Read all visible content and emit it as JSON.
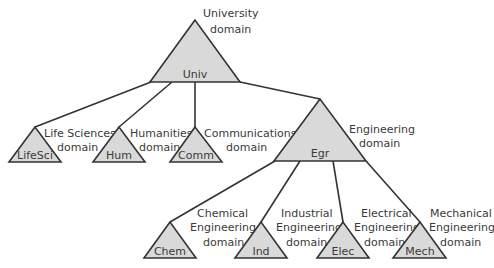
{
  "diagram": {
    "type": "domain-tree",
    "nodes": [
      {
        "id": "univ",
        "label": "Univ",
        "domain_lines": [
          "University",
          "domain"
        ]
      },
      {
        "id": "lifesci",
        "label": "LifeSci",
        "domain_lines": [
          "Life Sciences",
          "domain"
        ]
      },
      {
        "id": "hum",
        "label": "Hum",
        "domain_lines": [
          "Humanities",
          "domain"
        ]
      },
      {
        "id": "comm",
        "label": "Comm",
        "domain_lines": [
          "Communications",
          "domain"
        ]
      },
      {
        "id": "egr",
        "label": "Egr",
        "domain_lines": [
          "Engineering",
          "domain"
        ]
      },
      {
        "id": "chem",
        "label": "Chem",
        "domain_lines": [
          "Chemical",
          "Engineering",
          "domain"
        ]
      },
      {
        "id": "ind",
        "label": "Ind",
        "domain_lines": [
          "Industrial",
          "Engineering",
          "domain"
        ]
      },
      {
        "id": "elec",
        "label": "Elec",
        "domain_lines": [
          "Electrical",
          "Engineering",
          "domain"
        ]
      },
      {
        "id": "mech",
        "label": "Mech",
        "domain_lines": [
          "Mechanical",
          "Engineering",
          "domain"
        ]
      }
    ],
    "edges": [
      {
        "from": "univ",
        "to": "lifesci"
      },
      {
        "from": "univ",
        "to": "hum"
      },
      {
        "from": "univ",
        "to": "comm"
      },
      {
        "from": "univ",
        "to": "egr"
      },
      {
        "from": "egr",
        "to": "chem"
      },
      {
        "from": "egr",
        "to": "ind"
      },
      {
        "from": "egr",
        "to": "elec"
      },
      {
        "from": "egr",
        "to": "mech"
      }
    ],
    "colors": {
      "triangle_fill": "#d9d9d9",
      "stroke": "#333333",
      "text": "#3a3a3a"
    }
  }
}
